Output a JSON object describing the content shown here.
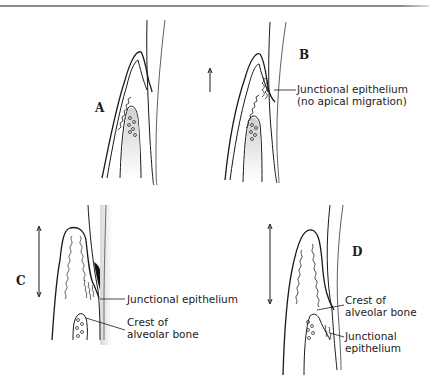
{
  "figure": {
    "panels": [
      {
        "id": "A",
        "label": "A"
      },
      {
        "id": "B",
        "label": "B"
      },
      {
        "id": "C",
        "label": "C"
      },
      {
        "id": "D",
        "label": "D"
      }
    ],
    "annotations": {
      "b_junctional": [
        "Junctional epithelium",
        "(no apical migration)"
      ],
      "c_junctional": "Junctional epithelium",
      "c_crest": [
        "Crest of",
        "alveolar bone"
      ],
      "d_crest": [
        "Crest of",
        "alveolar bone"
      ],
      "d_junctional": [
        "Junctional",
        "epithelium"
      ]
    },
    "colors": {
      "line": "#1a1a1a",
      "stipple": "#bdbdbd",
      "dark_fill": "#111111",
      "border": "#8a8a8a"
    }
  }
}
